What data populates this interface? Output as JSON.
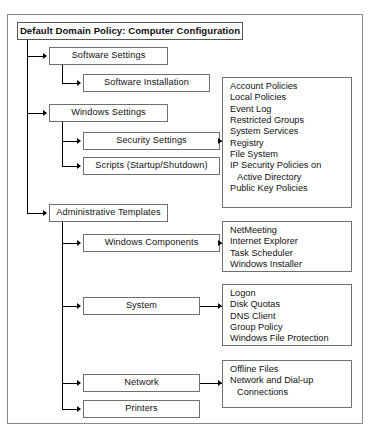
{
  "diagram": {
    "title_node": {
      "label": "Default Domain Policy: Computer Configuration"
    },
    "nodes": {
      "software_settings": "Software Settings",
      "software_installation": "Software Installation",
      "windows_settings": "Windows Settings",
      "security_settings": "Security Settings",
      "scripts": "Scripts (Startup/Shutdown)",
      "administrative_templates": "Administrative Templates",
      "windows_components": "Windows Components",
      "system": "System",
      "network": "Network",
      "printers": "Printers"
    },
    "lists": {
      "security_settings_items": [
        "Account Policies",
        "Local Policies",
        "Event Log",
        "Restricted Groups",
        "System Services",
        "Registry",
        "File System",
        "IP Security Policies on",
        "Active Directory",
        "Public Key Policies"
      ],
      "windows_components_items": [
        "NetMeeting",
        "Internet Explorer",
        "Task Scheduler",
        "Windows Installer"
      ],
      "system_items": [
        "Logon",
        "Disk Quotas",
        "DNS Client",
        "Group Policy",
        "Windows File Protection"
      ],
      "network_items": [
        "Offline Files",
        "Network and Dial-up",
        "Connections"
      ]
    },
    "colors": {
      "box_border": "#6f6f6f",
      "frame_border": "#8a8a8a",
      "connector": "#000000",
      "text": "#111111",
      "background": "#ffffff"
    }
  }
}
